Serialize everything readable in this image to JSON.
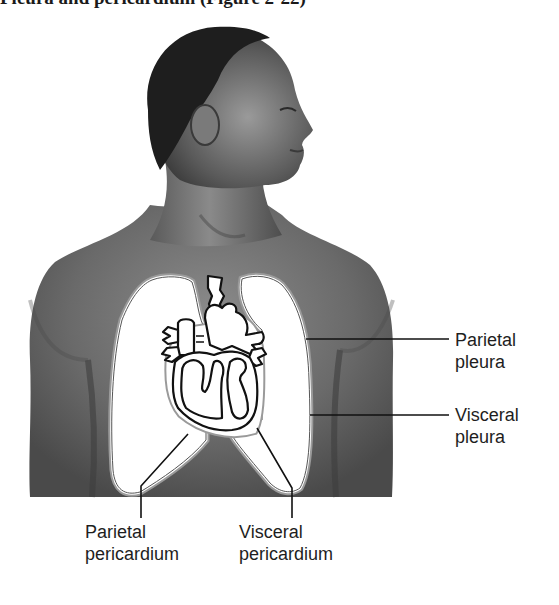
{
  "heading": {
    "text": "Pleura and pericardium (Figure 2-22)"
  },
  "figure": {
    "colors": {
      "skin_dark": "#3a3a3a",
      "skin_mid": "#6e6e6e",
      "skin_light": "#9a9a9a",
      "organ_fill": "#ffffff",
      "outline": "#111111",
      "membrane_line": "#8a8a8a"
    }
  },
  "labels": {
    "parietal_pleura": {
      "line1": "Parietal",
      "line2": "pleura"
    },
    "visceral_pleura": {
      "line1": "Visceral",
      "line2": "pleura"
    },
    "parietal_pericardium": {
      "line1": "Parietal",
      "line2": "pericardium"
    },
    "visceral_pericardium": {
      "line1": "Visceral",
      "line2": "pericardium"
    }
  }
}
